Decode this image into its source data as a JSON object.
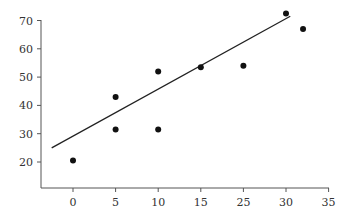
{
  "chart_data": {
    "type": "scatter",
    "title": "",
    "xlabel": "",
    "ylabel": "",
    "x_tick_labels": [
      "0",
      "5",
      "10",
      "15",
      "25",
      "30",
      "35"
    ],
    "y_tick_labels": [
      "20",
      "30",
      "40",
      "50",
      "60",
      "70"
    ],
    "y_ticks": [
      20,
      30,
      40,
      50,
      60,
      70
    ],
    "xlim_positions": [
      -5,
      35
    ],
    "ylim": [
      11,
      70
    ],
    "grid": false,
    "legend": null,
    "points": [
      {
        "x_pos": 0,
        "x_label": "0",
        "y": 20.5
      },
      {
        "x_pos": 5,
        "x_label": "5",
        "y": 43
      },
      {
        "x_pos": 5,
        "x_label": "5",
        "y": 31.5
      },
      {
        "x_pos": 10,
        "x_label": "10",
        "y": 52
      },
      {
        "x_pos": 10,
        "x_label": "10",
        "y": 31.5
      },
      {
        "x_pos": 15,
        "x_label": "15",
        "y": 53.5
      },
      {
        "x_pos": 20,
        "x_label": "25",
        "y": 54
      },
      {
        "x_pos": 25,
        "x_label": "30",
        "y": 72.5
      },
      {
        "x_pos": 27,
        "x_label": "between 30 and 35",
        "y": 67
      }
    ],
    "trend_line": {
      "x_start_pos": -2.5,
      "y_start": 25,
      "x_end_pos": 25.5,
      "y_end": 71.5
    },
    "note": "x tick labels skip 20 (sequence 0,5,10,15,25,30,35 evenly spaced); x_pos is position on an evenly spaced axis"
  },
  "colors": {
    "axis": "#555555",
    "points": "#111111",
    "trend_line": "#222222",
    "background": "#ffffff"
  }
}
